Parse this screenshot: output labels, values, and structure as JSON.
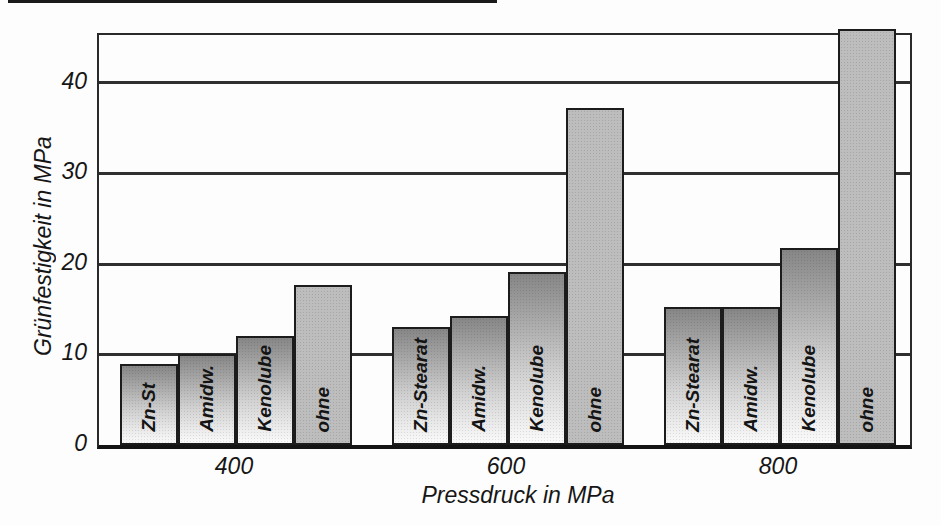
{
  "chart_data": {
    "type": "bar",
    "title": "",
    "xlabel": "Pressdruck in MPa",
    "ylabel": "Grünfestigkeit in MPa",
    "yticks": [
      0,
      10,
      20,
      30,
      40
    ],
    "ylim": [
      0,
      45.3
    ],
    "grid": "horizontal",
    "legend": "none",
    "categories": [
      "400",
      "600",
      "800"
    ],
    "groups": [
      {
        "category": "400",
        "bars": [
          {
            "label": "Zn-St",
            "value": 9.0,
            "fill": "gradient"
          },
          {
            "label": "Amidw.",
            "value": 10.1,
            "fill": "gradient"
          },
          {
            "label": "Kenolube",
            "value": 12.1,
            "fill": "gradient"
          },
          {
            "label": "ohne",
            "value": 17.7,
            "fill": "flat"
          }
        ]
      },
      {
        "category": "600",
        "bars": [
          {
            "label": "Zn-Stearat",
            "value": 13.0,
            "fill": "gradient"
          },
          {
            "label": "Amidw.",
            "value": 14.2,
            "fill": "gradient"
          },
          {
            "label": "Kenolube",
            "value": 19.1,
            "fill": "gradient"
          },
          {
            "label": "ohne",
            "value": 37.2,
            "fill": "flat"
          }
        ]
      },
      {
        "category": "800",
        "bars": [
          {
            "label": "Zn-Stearat",
            "value": 15.3,
            "fill": "gradient"
          },
          {
            "label": "Amidw.",
            "value": 15.3,
            "fill": "gradient"
          },
          {
            "label": "Kenolube",
            "value": 21.8,
            "fill": "gradient"
          },
          {
            "label": "ohne",
            "value": 46.0,
            "fill": "flat",
            "clipped": true
          }
        ]
      }
    ]
  },
  "styles": {
    "background": "#fdfdfd",
    "bar_gradient_top": "#868686",
    "bar_gradient_bottom": "#fafafa",
    "ohne_bar_fill": "#bdbdbd",
    "outline_color": "#1c1c1c",
    "gridline_color": "#2f2f2f",
    "text_color": "#161616"
  }
}
